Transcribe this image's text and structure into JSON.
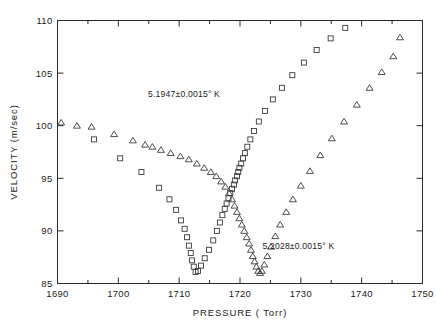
{
  "figure": {
    "title": "",
    "background": "#ffffff",
    "marker_color": "#3a3a3a",
    "axis_color": "#2a2a2a"
  },
  "annotations": {
    "series_a_label": "5.1947±0.0015° K",
    "series_b_label": "5.2028±0.0015° K"
  },
  "chart_data": {
    "type": "scatter",
    "title": "",
    "xlabel": "PRESSURE  ( Torr)",
    "ylabel": "VELOCITY  (m/sec)",
    "xlim": [
      1690,
      1750
    ],
    "ylim": [
      85,
      110
    ],
    "xticks": [
      1690,
      1700,
      1710,
      1720,
      1730,
      1740,
      1750
    ],
    "xticklabels": [
      "1690",
      "1700",
      "1710",
      "1720",
      "1730",
      "1740",
      "1750"
    ],
    "xminorticks": [
      1695,
      1705,
      1715,
      1725,
      1735,
      1745
    ],
    "yticks": [
      85,
      90,
      95,
      100,
      105,
      110
    ],
    "yticklabels": [
      "85",
      "90",
      "95",
      "100",
      "105",
      "110"
    ],
    "yminorticks": [],
    "grid": false,
    "legend": "none",
    "series": [
      {
        "name": "5.1947±0.0015° K",
        "marker": "square",
        "label_x": 1710.8,
        "label_y": 102.7,
        "x": [
          1696.0,
          1700.3,
          1703.8,
          1706.7,
          1708.4,
          1709.5,
          1710.3,
          1710.9,
          1711.3,
          1711.6,
          1711.9,
          1712.1,
          1712.4,
          1712.7,
          1713.1,
          1713.6,
          1714.2,
          1714.9,
          1715.6,
          1716.2,
          1716.7,
          1717.1,
          1717.5,
          1717.8,
          1718.1,
          1718.4,
          1718.7,
          1719.0,
          1719.2,
          1719.5,
          1719.7,
          1719.9,
          1720.2,
          1720.5,
          1720.8,
          1721.2,
          1721.7,
          1722.3,
          1723.1,
          1724.1,
          1725.4,
          1726.9,
          1728.6,
          1730.5,
          1732.6,
          1734.9,
          1737.3
        ],
        "y": [
          98.7,
          96.9,
          95.6,
          94.1,
          93.0,
          92.0,
          91.0,
          90.2,
          89.4,
          88.6,
          87.9,
          87.2,
          86.6,
          86.1,
          86.2,
          86.7,
          87.4,
          88.2,
          89.1,
          90.0,
          90.8,
          91.5,
          92.1,
          92.6,
          93.1,
          93.6,
          94.0,
          94.4,
          94.8,
          95.2,
          95.6,
          96.0,
          96.4,
          96.9,
          97.4,
          98.0,
          98.7,
          99.5,
          100.4,
          101.4,
          102.5,
          103.6,
          104.8,
          106.0,
          107.2,
          108.3,
          109.3
        ]
      },
      {
        "name": "5.2028±0.0015° K",
        "marker": "triangle",
        "label_x": 1729.6,
        "label_y": 88.3,
        "x": [
          1690.6,
          1693.2,
          1695.6,
          1699.3,
          1702.4,
          1704.4,
          1705.6,
          1707.0,
          1708.6,
          1710.2,
          1711.6,
          1712.9,
          1714.1,
          1715.2,
          1716.1,
          1716.9,
          1717.6,
          1718.2,
          1718.7,
          1719.1,
          1719.5,
          1719.9,
          1720.3,
          1720.7,
          1721.1,
          1721.5,
          1721.8,
          1722.1,
          1722.4,
          1722.7,
          1723.0,
          1723.3,
          1723.6,
          1724.0,
          1724.5,
          1725.1,
          1725.8,
          1726.6,
          1727.6,
          1728.7,
          1730.0,
          1731.5,
          1733.2,
          1735.1,
          1737.1,
          1739.2,
          1741.3,
          1743.3,
          1745.2,
          1746.3
        ],
        "y": [
          100.3,
          100.0,
          99.9,
          99.2,
          98.6,
          98.2,
          98.0,
          97.7,
          97.4,
          97.1,
          96.8,
          96.4,
          96.0,
          95.6,
          95.2,
          94.7,
          94.2,
          93.6,
          93.0,
          92.4,
          91.8,
          91.2,
          90.6,
          90.0,
          89.4,
          88.8,
          88.2,
          87.6,
          87.1,
          86.6,
          86.2,
          86.0,
          86.2,
          86.8,
          87.6,
          88.5,
          89.5,
          90.6,
          91.8,
          93.0,
          94.3,
          95.7,
          97.2,
          98.8,
          100.4,
          102.0,
          103.6,
          105.1,
          106.6,
          108.4
        ]
      }
    ]
  }
}
